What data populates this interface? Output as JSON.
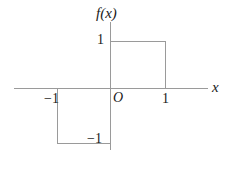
{
  "chart_data": {
    "type": "line",
    "title": "",
    "subtitle": "",
    "xlabel": "x",
    "ylabel": "f(x)",
    "xlim": [
      -1.75,
      1.8
    ],
    "ylim": [
      -1.4,
      1.45
    ],
    "grid": false,
    "legend": null,
    "axis_labels": {
      "y_axis": "f(x)",
      "x_axis": "x",
      "origin": "O"
    },
    "xticks": [
      {
        "value": -1,
        "label": "−1"
      },
      {
        "value": 1,
        "label": "1"
      }
    ],
    "yticks": [
      {
        "value": -1,
        "label": "−1"
      },
      {
        "value": 1,
        "label": "1"
      }
    ],
    "series": [
      {
        "name": "f(x) lower step",
        "points": [
          {
            "x": -1,
            "y": 0
          },
          {
            "x": -1,
            "y": -1
          },
          {
            "x": 0,
            "y": -1
          }
        ]
      },
      {
        "name": "f(x) upper step",
        "points": [
          {
            "x": 0,
            "y": 1
          },
          {
            "x": 1,
            "y": 1
          },
          {
            "x": 1,
            "y": 0
          }
        ]
      }
    ],
    "colors": {
      "line": "#9a9a9a",
      "text": "#1a1a1a",
      "background": "#ffffff"
    }
  }
}
